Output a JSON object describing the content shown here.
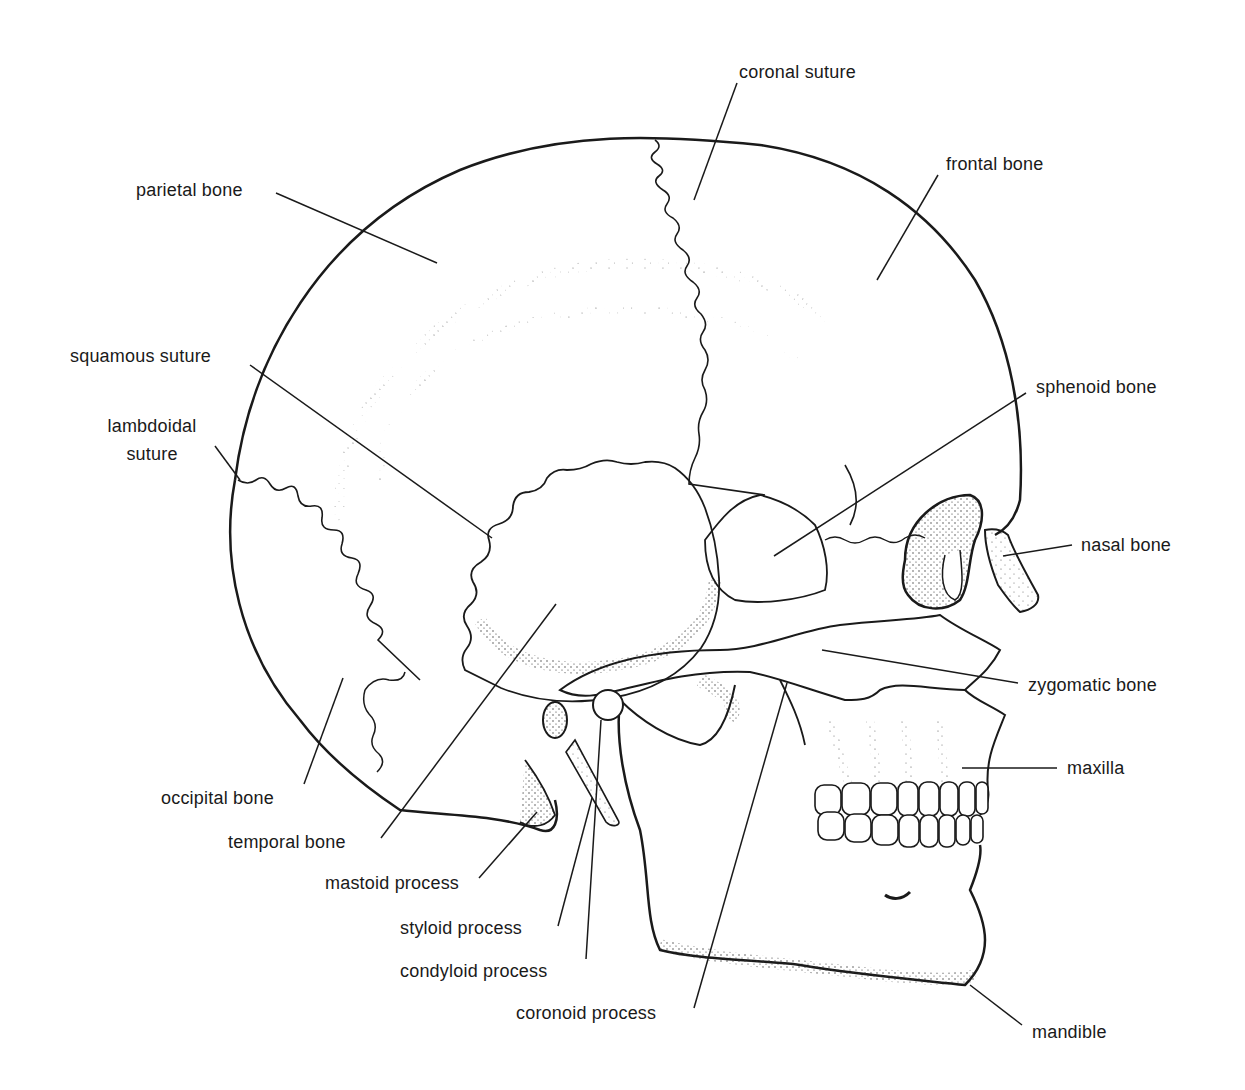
{
  "figure": {
    "ink_color": "#1a1a1a",
    "background_color": "#ffffff"
  },
  "labels": {
    "coronal_suture": "coronal suture",
    "frontal_bone": "frontal bone",
    "parietal_bone": "parietal bone",
    "squamous_suture": "squamous suture",
    "lambdoidal_suture_line1": "lambdoidal",
    "lambdoidal_suture_line2": "suture",
    "sphenoid_bone": "sphenoid bone",
    "nasal_bone": "nasal bone",
    "zygomatic_bone": "zygomatic bone",
    "maxilla": "maxilla",
    "occipital_bone": "occipital bone",
    "temporal_bone": "temporal bone",
    "mastoid_process": "mastoid process",
    "styloid_process": "styloid process",
    "condyloid_process": "condyloid process",
    "coronoid_process": "coronoid process",
    "mandible": "mandible"
  }
}
